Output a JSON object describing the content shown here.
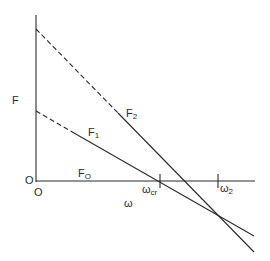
{
  "diagram": {
    "y_axis_label": "F",
    "x_axis_label": "ω",
    "origin_label_y": "O",
    "origin_label_x": "O",
    "lines": [
      {
        "name": "F0",
        "label_main": "F",
        "label_sub": "O",
        "style": "solid",
        "note": "along ω axis"
      },
      {
        "name": "F1",
        "label_main": "F",
        "label_sub": "1",
        "style": "dashed-then-solid"
      },
      {
        "name": "F2",
        "label_main": "F",
        "label_sub": "2",
        "style": "dashed-then-solid"
      }
    ],
    "ticks": [
      {
        "name": "omega-cr",
        "label_main": "ω",
        "label_sub": "cr"
      },
      {
        "name": "omega-2",
        "label_main": "ω",
        "label_sub": "2"
      }
    ]
  }
}
